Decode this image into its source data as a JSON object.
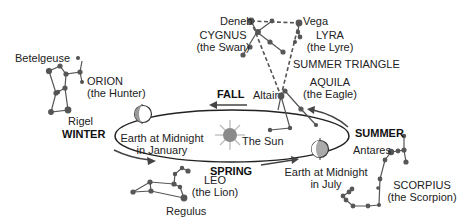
{
  "diagram": {
    "seasons": {
      "fall": "FALL",
      "winter": "WINTER",
      "spring": "SPRING",
      "summer": "SUMMER"
    },
    "sun": {
      "label": "The Sun",
      "icon": "sun-icon"
    },
    "earth_positions": [
      {
        "line1": "Earth at Midnight",
        "line2": "in January"
      },
      {
        "line1": "Earth at Midnight",
        "line2": "in July"
      }
    ],
    "constellations": {
      "orion": {
        "name": "ORION",
        "subtitle": "(the Hunter)",
        "stars": [
          "Betelgeuse",
          "Rigel"
        ]
      },
      "cygnus": {
        "name": "CYGNUS",
        "subtitle": "(the Swan)",
        "stars": [
          "Deneb"
        ]
      },
      "lyra": {
        "name": "LYRA",
        "subtitle": "(the Lyre)",
        "stars": [
          "Vega"
        ]
      },
      "aquila": {
        "name": "AQUILA",
        "subtitle": "(the Eagle)",
        "stars": [
          "Altair"
        ]
      },
      "leo": {
        "name": "LEO",
        "subtitle": "(the Lion)",
        "stars": [
          "Regulus"
        ]
      },
      "scorpius": {
        "name": "SCORPIUS",
        "subtitle": "(the Scorpion)",
        "stars": [
          "Antares"
        ]
      }
    },
    "asterism": {
      "name": "SUMMER TRIANGLE"
    },
    "colors": {
      "line": "#222222",
      "star": "#555555",
      "sun": "#8a8a8a",
      "sun_rays": "#bbbbbb",
      "earth_shadow": "#999999"
    }
  }
}
